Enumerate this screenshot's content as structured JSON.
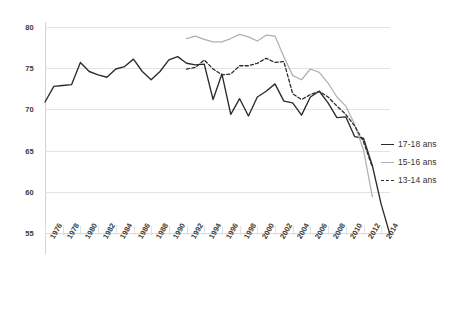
{
  "chart_data": {
    "type": "line",
    "title": "",
    "subtitle": "",
    "xlabel": "",
    "ylabel": "",
    "ylim": [
      55,
      80
    ],
    "y_ticks": [
      55,
      60,
      65,
      70,
      75,
      80
    ],
    "xlim": [
      1976,
      2015
    ],
    "x_ticks": [
      1976,
      1978,
      1980,
      1982,
      1984,
      1986,
      1988,
      1990,
      1992,
      1994,
      1996,
      1998,
      2000,
      2002,
      2004,
      2006,
      2008,
      2010,
      2012,
      2014
    ],
    "x_tick_labels": [
      "1976",
      "1978",
      "1980",
      "1982",
      "1984",
      "1986",
      "1988",
      "1990",
      "1992",
      "1994",
      "1996",
      "1998",
      "2000",
      "2002",
      "2004",
      "2006",
      "2008",
      "2010",
      "2012",
      "2014"
    ],
    "grid": "horizontal",
    "legend_position": "right",
    "series": [
      {
        "name": "17-18 ans",
        "style": "solid",
        "color": "#2b2b2b",
        "x": [
          1976,
          1977,
          1978,
          1979,
          1980,
          1981,
          1982,
          1983,
          1984,
          1985,
          1986,
          1987,
          1988,
          1989,
          1990,
          1991,
          1992,
          1993,
          1994,
          1995,
          1996,
          1997,
          1998,
          1999,
          2000,
          2001,
          2002,
          2003,
          2004,
          2005,
          2006,
          2007,
          2008,
          2009,
          2010,
          2011,
          2012,
          2013,
          2014,
          2015
        ],
        "values": [
          70.9,
          72.8,
          72.9,
          73.0,
          75.7,
          74.6,
          74.2,
          73.9,
          74.9,
          75.2,
          76.1,
          74.6,
          73.6,
          74.6,
          76.0,
          76.4,
          75.6,
          75.4,
          75.5,
          71.2,
          74.3,
          69.4,
          71.3,
          69.2,
          71.5,
          72.2,
          73.1,
          71.0,
          70.8,
          69.3,
          71.5,
          72.2,
          70.8,
          69.0,
          69.1,
          66.7,
          66.5,
          63.2,
          58.5,
          54.8
        ]
      },
      {
        "name": "15-16 ans",
        "style": "solid",
        "color": "#b0b0b0",
        "x": [
          1992,
          1993,
          1994,
          1995,
          1996,
          1997,
          1998,
          1999,
          2000,
          2001,
          2002,
          2003,
          2004,
          2005,
          2006,
          2007,
          2008,
          2009,
          2010,
          2011,
          2012,
          2013
        ],
        "values": [
          78.6,
          78.9,
          78.5,
          78.2,
          78.2,
          78.6,
          79.1,
          78.8,
          78.3,
          79.0,
          78.9,
          76.4,
          74.1,
          73.6,
          74.9,
          74.5,
          73.2,
          71.5,
          70.4,
          68.2,
          65.1,
          59.4
        ]
      },
      {
        "name": "13-14 ans",
        "style": "dashed",
        "color": "#2b2b2b",
        "x": [
          1992,
          1993,
          1994,
          1995,
          1996,
          1997,
          1998,
          1999,
          2000,
          2001,
          2002,
          2003,
          2004,
          2005,
          2006,
          2007,
          2008,
          2009,
          2010,
          2011,
          2012,
          2013
        ],
        "values": [
          74.9,
          75.1,
          76.0,
          74.9,
          74.2,
          74.3,
          75.3,
          75.3,
          75.6,
          76.2,
          75.7,
          75.8,
          71.9,
          71.2,
          71.8,
          72.2,
          71.5,
          70.4,
          69.4,
          68.0,
          66.1,
          63.0
        ]
      }
    ]
  },
  "legend": {
    "items": [
      {
        "label": "17-18 ans",
        "swatch": "s-solid-dark"
      },
      {
        "label": "15-16 ans",
        "swatch": "s-solid-gray"
      },
      {
        "label": "13-14 ans",
        "swatch": "s-dashed"
      }
    ]
  }
}
